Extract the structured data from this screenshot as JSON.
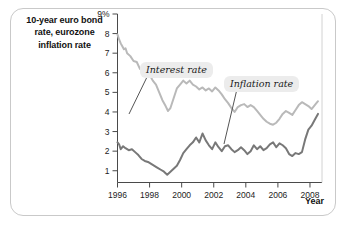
{
  "figure": {
    "title_lines": [
      "10-year euro bond",
      "rate, eurozone",
      "inflation rate"
    ],
    "title_full": "10-year euro bond rate, eurozone inflation rate",
    "frame_color": "#c9c9c9",
    "background": "#ffffff"
  },
  "annotations": {
    "interest_label": "Interest rate",
    "inflation_label": "Inflation rate",
    "callout_bg": "#ececec"
  },
  "axes": {
    "x_title": "Year",
    "y_ticks": [
      "9%",
      "8",
      "7",
      "6",
      "5",
      "4",
      "3",
      "2",
      "1"
    ],
    "x_ticks": [
      "1996",
      "1998",
      "2000",
      "2002",
      "2004",
      "2006",
      "2008"
    ]
  },
  "chart_data": {
    "type": "line",
    "title": "10-year euro bond rate, eurozone inflation rate",
    "xlabel": "Year",
    "ylabel": "",
    "xlim": [
      1996,
      2008.75
    ],
    "ylim": [
      0.4,
      9
    ],
    "grid": false,
    "legend": "inline-callouts",
    "y_tick_values": [
      9,
      8,
      7,
      6,
      5,
      4,
      3,
      2,
      1
    ],
    "y_tick_labels": [
      "9%",
      "8",
      "7",
      "6",
      "5",
      "4",
      "3",
      "2",
      "1"
    ],
    "x_tick_values": [
      1996,
      1998,
      2000,
      2002,
      2004,
      2006,
      2008
    ],
    "x_tick_labels": [
      "1996",
      "1998",
      "2000",
      "2002",
      "2004",
      "2006",
      "2008"
    ],
    "series": [
      {
        "name": "Interest rate",
        "color": "#b9b9b9",
        "label_text": "Interest rate",
        "x": [
          1996.0,
          1996.1,
          1996.2,
          1996.3,
          1996.4,
          1996.5,
          1996.6,
          1996.8,
          1997.0,
          1997.2,
          1997.4,
          1997.6,
          1997.8,
          1998.0,
          1998.2,
          1998.4,
          1998.6,
          1998.8,
          1999.0,
          1999.15,
          1999.3,
          1999.5,
          1999.7,
          1999.9,
          2000.1,
          2000.3,
          2000.5,
          2000.7,
          2000.9,
          2001.1,
          2001.3,
          2001.5,
          2001.7,
          2001.9,
          2002.1,
          2002.3,
          2002.5,
          2002.7,
          2002.9,
          2003.1,
          2003.3,
          2003.5,
          2003.7,
          2003.9,
          2004.1,
          2004.3,
          2004.5,
          2004.7,
          2004.9,
          2005.1,
          2005.3,
          2005.5,
          2005.7,
          2005.9,
          2006.1,
          2006.3,
          2006.5,
          2006.7,
          2006.9,
          2007.1,
          2007.3,
          2007.5,
          2007.7,
          2007.9,
          2008.1,
          2008.3,
          2008.5
        ],
        "y": [
          7.95,
          7.7,
          7.5,
          7.35,
          7.2,
          7.25,
          7.0,
          6.85,
          6.6,
          6.55,
          6.2,
          6.1,
          6.3,
          5.9,
          5.6,
          5.4,
          5.0,
          4.6,
          4.3,
          4.05,
          4.2,
          4.7,
          5.2,
          5.4,
          5.6,
          5.45,
          5.6,
          5.4,
          5.3,
          5.15,
          5.25,
          5.1,
          5.2,
          5.05,
          5.25,
          5.1,
          4.9,
          4.65,
          4.45,
          4.2,
          4.0,
          4.25,
          4.35,
          4.4,
          4.25,
          4.35,
          4.25,
          4.05,
          3.85,
          3.65,
          3.5,
          3.4,
          3.35,
          3.45,
          3.65,
          3.9,
          4.05,
          3.95,
          3.85,
          4.1,
          4.35,
          4.5,
          4.4,
          4.3,
          4.15,
          4.35,
          4.55
        ]
      },
      {
        "name": "Inflation rate",
        "color": "#787878",
        "label_text": "Inflation rate",
        "x": [
          1996.0,
          1996.1,
          1996.2,
          1996.35,
          1996.5,
          1996.7,
          1996.9,
          1997.1,
          1997.3,
          1997.5,
          1997.7,
          1997.9,
          1998.1,
          1998.3,
          1998.5,
          1998.7,
          1998.9,
          1999.1,
          1999.3,
          1999.5,
          1999.7,
          1999.9,
          2000.1,
          2000.3,
          2000.5,
          2000.7,
          2000.9,
          2001.1,
          2001.3,
          2001.5,
          2001.7,
          2001.9,
          2002.1,
          2002.3,
          2002.5,
          2002.7,
          2002.9,
          2003.1,
          2003.3,
          2003.5,
          2003.7,
          2003.9,
          2004.1,
          2004.3,
          2004.5,
          2004.7,
          2004.9,
          2005.1,
          2005.3,
          2005.5,
          2005.7,
          2005.9,
          2006.1,
          2006.3,
          2006.5,
          2006.7,
          2006.9,
          2007.1,
          2007.3,
          2007.5,
          2007.7,
          2007.9,
          2008.1,
          2008.3,
          2008.5
        ],
        "y": [
          2.45,
          2.35,
          2.1,
          2.25,
          2.15,
          2.05,
          2.1,
          1.95,
          1.8,
          1.6,
          1.5,
          1.45,
          1.35,
          1.25,
          1.15,
          1.05,
          0.95,
          0.8,
          0.95,
          1.1,
          1.25,
          1.55,
          1.9,
          2.1,
          2.3,
          2.45,
          2.7,
          2.45,
          2.9,
          2.55,
          2.3,
          2.1,
          2.45,
          2.2,
          2.0,
          2.25,
          2.3,
          2.1,
          1.95,
          2.05,
          2.2,
          2.05,
          1.85,
          2.0,
          2.3,
          2.1,
          2.25,
          2.05,
          2.15,
          2.35,
          2.45,
          2.2,
          2.4,
          2.3,
          2.15,
          1.85,
          1.75,
          1.9,
          1.85,
          1.95,
          2.6,
          3.1,
          3.3,
          3.6,
          3.9
        ]
      }
    ]
  }
}
